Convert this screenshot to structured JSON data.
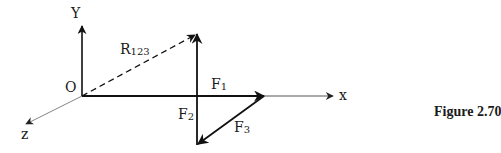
{
  "figure": {
    "caption": "Figure 2.70",
    "labels": {
      "y_axis": "Y",
      "x_axis": "x",
      "z_axis": "z",
      "origin": "O",
      "resultant": {
        "main": "R",
        "sub": "123"
      },
      "f1": {
        "main": "F",
        "sub": "1"
      },
      "f2": {
        "main": "F",
        "sub": "2"
      },
      "f3": {
        "main": "F",
        "sub": "3"
      }
    },
    "colors": {
      "vector": "#111111",
      "axis_thin": "#777777",
      "text": "#1a1a1a"
    },
    "geometry": {
      "origin": [
        82,
        96
      ],
      "y_axis_tip": [
        82,
        26
      ],
      "x_axis_tip": [
        333,
        96
      ],
      "z_axis_tip": [
        26,
        124
      ],
      "f1_tip": [
        264,
        96
      ],
      "f2_vertical_top": [
        197,
        34
      ],
      "f2_vertical_bottom": [
        197,
        145
      ],
      "f3_start": [
        264,
        96
      ],
      "f3_tip": [
        198,
        144
      ],
      "r123_tip": [
        195,
        35
      ]
    }
  }
}
